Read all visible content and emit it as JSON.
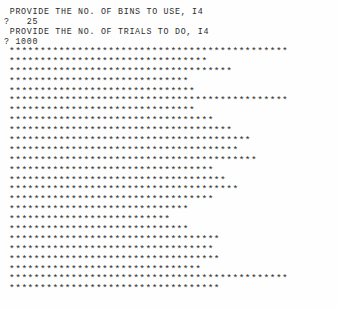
{
  "terminal": {
    "program_name": "bin-histogram-teletype",
    "background_color": "#fefefe",
    "text_color": "#2b2b2b"
  },
  "prompts": [
    {
      "id": "bins-prompt",
      "text": " PROVIDE THE NO. OF BINS TO USE, I4"
    },
    {
      "id": "bins-answer",
      "text": "?   25"
    },
    {
      "id": "trials-prompt",
      "text": " PROVIDE THE NO. OF TRIALS TO DO, I4"
    },
    {
      "id": "trials-answer",
      "text": "? 1000"
    }
  ],
  "inputs": {
    "bins_label": "PROVIDE THE NO. OF BINS TO USE, I4",
    "bins_value": "25",
    "bins_format": "I4",
    "trials_label": "PROVIDE THE NO. OF TRIALS TO DO, I4",
    "trials_value": "1000",
    "trials_format": "I4",
    "prompt_symbol": "?"
  },
  "chart_data": {
    "type": "bar",
    "orientation": "horizontal",
    "title": "",
    "subtitle": "",
    "xlabel": "",
    "ylabel": "",
    "marker": "*",
    "grid": false,
    "legend": false,
    "bins": 25,
    "trials": 1000,
    "categories": [
      "1",
      "2",
      "3",
      "4",
      "5",
      "6",
      "7",
      "8",
      "9",
      "10",
      "11",
      "12",
      "13",
      "14",
      "15",
      "16",
      "17",
      "18",
      "19",
      "20",
      "21",
      "22",
      "23",
      "24",
      "25"
    ],
    "values": [
      45,
      32,
      36,
      29,
      30,
      45,
      30,
      33,
      36,
      39,
      37,
      40,
      33,
      35,
      37,
      33,
      29,
      26,
      29,
      34,
      33,
      34,
      31,
      45,
      34
    ],
    "xlim": [
      0,
      45
    ],
    "rows": [
      "*********************************************",
      "********************************",
      "************************************",
      "*****************************",
      "******************************",
      "*********************************************",
      "******************************",
      "*********************************",
      "************************************",
      "***************************************",
      "*************************************",
      "****************************************",
      "*********************************",
      "***********************************",
      "*************************************",
      "*********************************",
      "*****************************",
      "**************************",
      "*****************************",
      "**********************************",
      "*********************************",
      "**********************************",
      "*******************************",
      "*********************************************",
      "**********************************"
    ]
  }
}
